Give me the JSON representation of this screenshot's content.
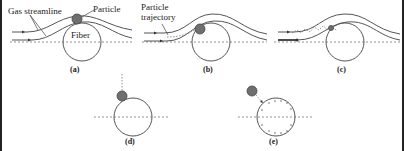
{
  "labels": {
    "gas_streamline": "Gas streamline",
    "particle": "Particle",
    "fiber": "Fiber",
    "particle_trajectory_line1": "Particle",
    "particle_trajectory_line2": "trajectory"
  },
  "panels": [
    {
      "id": "a",
      "caption": "(a)",
      "mechanism": "interception"
    },
    {
      "id": "b",
      "caption": "(b)",
      "mechanism": "inertial impaction"
    },
    {
      "id": "c",
      "caption": "(c)",
      "mechanism": "diffusion"
    },
    {
      "id": "d",
      "caption": "(d)",
      "mechanism": "gravitational settling"
    },
    {
      "id": "e",
      "caption": "(e)",
      "mechanism": "electrostatic attraction"
    }
  ],
  "colors": {
    "particle": "#6f6f6f",
    "line": "#555555",
    "border": "#222222"
  }
}
